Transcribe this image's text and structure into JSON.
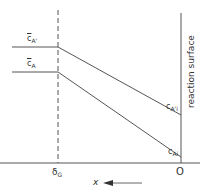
{
  "diagram": {
    "type": "concentration-profile",
    "labels": {
      "bulk_upper": {
        "symbol": "c",
        "subscript": "A'",
        "overbar": true
      },
      "bulk_lower": {
        "symbol": "c",
        "subscript": "A",
        "overbar": true
      },
      "interface_upper": {
        "symbol": "c",
        "subscript": "A'i"
      },
      "interface_lower": {
        "symbol": "c",
        "subscript": "Ai"
      },
      "film_thickness": {
        "symbol": "δ",
        "subscript": "G"
      },
      "origin": "O",
      "axis_variable": "x",
      "surface_label": "reaction surface"
    },
    "colors": {
      "line": "#555555",
      "text": "#333333",
      "background": "#ffffff"
    }
  }
}
